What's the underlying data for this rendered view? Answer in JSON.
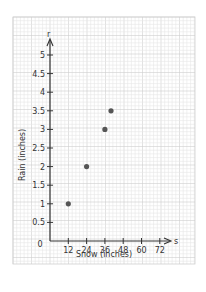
{
  "chart_data": {
    "type": "scatter",
    "title": "",
    "xlabel": "Snow (inches)",
    "ylabel": "Rain (inches)",
    "x_axis_var": "s",
    "y_axis_var": "r",
    "origin_label": "0",
    "xlim": [
      0,
      80
    ],
    "ylim": [
      0,
      5.3
    ],
    "x_ticks": [
      12,
      24,
      36,
      48,
      60,
      72
    ],
    "y_ticks": [
      0.5,
      1,
      1.5,
      2,
      2.5,
      3,
      3.5,
      4,
      4.5,
      5
    ],
    "x_tick_labels": [
      "12",
      "24",
      "36",
      "48",
      "60",
      "72"
    ],
    "y_tick_labels": [
      "0.5",
      "1",
      "1.5",
      "2",
      "2.5",
      "3",
      "3.5",
      "4",
      "4.5",
      "5"
    ],
    "grid": true,
    "series": [
      {
        "name": "data",
        "points": [
          {
            "x": 12,
            "y": 1
          },
          {
            "x": 24,
            "y": 2
          },
          {
            "x": 36,
            "y": 3
          },
          {
            "x": 40,
            "y": 3.5
          }
        ]
      }
    ],
    "colors": {
      "point": "#555555",
      "axis": "#333333",
      "grid_major": "#cfcfcf",
      "grid_minor": "#e6e6e6"
    }
  }
}
